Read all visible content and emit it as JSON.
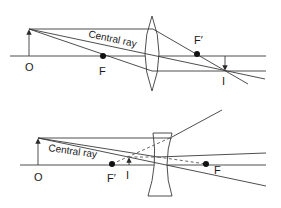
{
  "diagram": {
    "type": "ray-optics",
    "colors": {
      "line": "#3a3a3a",
      "text": "#1a1a1a",
      "background": "#ffffff"
    },
    "top": {
      "lens_type": "converging (convex)",
      "labels": {
        "object": "O",
        "focal_near": "F",
        "focal_far": "F′",
        "image": "I",
        "central_ray": "Central ray"
      }
    },
    "bottom": {
      "lens_type": "diverging (concave)",
      "labels": {
        "object": "O",
        "focal_near": "F′",
        "focal_far": "F",
        "image": "I",
        "central_ray": "Central ray"
      }
    }
  }
}
